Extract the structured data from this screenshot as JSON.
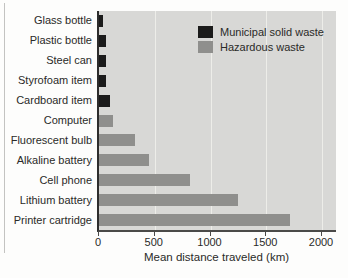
{
  "figure": {
    "background": "#fdfdfc",
    "plot_background": "#d8d8d6",
    "gridline_color": "#edede9",
    "axis_color": "#2d2d2d",
    "text_color": "#2a2a28"
  },
  "legend": {
    "items": [
      {
        "label": "Municipal solid waste",
        "color": "#1b1b1b"
      },
      {
        "label": "Hazardous waste",
        "color": "#8f8f8d"
      }
    ]
  },
  "chart_data": {
    "type": "bar",
    "orientation": "horizontal",
    "title": "",
    "xlabel": "Mean distance traveled (km)",
    "ylabel": "",
    "categories": [
      "Glass bottle",
      "Plastic bottle",
      "Steel can",
      "Styrofoam item",
      "Cardboard item",
      "Computer",
      "Fluorescent bulb",
      "Alkaline battery",
      "Cell phone",
      "Lithium battery",
      "Printer cartridge"
    ],
    "values": [
      35,
      65,
      60,
      65,
      100,
      130,
      320,
      450,
      820,
      1250,
      1710
    ],
    "groups": [
      "Municipal solid waste",
      "Municipal solid waste",
      "Municipal solid waste",
      "Municipal solid waste",
      "Municipal solid waste",
      "Hazardous waste",
      "Hazardous waste",
      "Hazardous waste",
      "Hazardous waste",
      "Hazardous waste",
      "Hazardous waste"
    ],
    "xticks": [
      0,
      500,
      1000,
      1500,
      2000
    ],
    "xlim": [
      0,
      2140
    ],
    "grid": "vertical gridlines at x ticks",
    "legend_position": "top-right inside plot"
  }
}
